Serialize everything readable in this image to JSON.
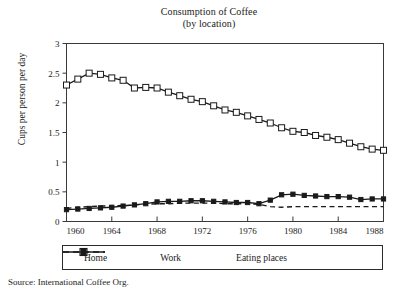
{
  "chart_data": {
    "type": "line",
    "title": "Consumption of Coffee",
    "subtitle": "(by location)",
    "xlabel": "",
    "ylabel": "Cups per person per day",
    "xlim": [
      1960,
      1988
    ],
    "ylim": [
      0,
      3
    ],
    "yticks": [
      "0",
      "0.5",
      "1",
      "1.5",
      "2",
      "2.5",
      "3"
    ],
    "ytick_values": [
      0,
      0.5,
      1,
      1.5,
      2,
      2.5,
      3
    ],
    "xticks": [
      "1960",
      "1964",
      "1968",
      "1972",
      "1976",
      "1980",
      "1984",
      "1988"
    ],
    "xtick_values": [
      1960,
      1964,
      1968,
      1972,
      1976,
      1980,
      1984,
      1988
    ],
    "grid": false,
    "legend_position": "below-axes",
    "x": [
      1960,
      1961,
      1962,
      1963,
      1964,
      1965,
      1966,
      1967,
      1968,
      1969,
      1970,
      1971,
      1972,
      1973,
      1974,
      1975,
      1976,
      1977,
      1978,
      1979,
      1980,
      1981,
      1982,
      1983,
      1984,
      1985,
      1986,
      1987,
      1988
    ],
    "series": [
      {
        "name": "Home",
        "marker": "open-square",
        "linestyle": "solid",
        "color": "#1a1a1a",
        "values": [
          2.3,
          2.4,
          2.5,
          2.48,
          2.42,
          2.38,
          2.25,
          2.26,
          2.25,
          2.18,
          2.12,
          2.06,
          2.02,
          1.95,
          1.88,
          1.84,
          1.78,
          1.72,
          1.66,
          1.58,
          1.52,
          1.5,
          1.45,
          1.42,
          1.38,
          1.32,
          1.26,
          1.22,
          1.2
        ]
      },
      {
        "name": "Work",
        "marker": "filled-square",
        "linestyle": "solid",
        "color": "#1a1a1a",
        "values": [
          0.2,
          0.21,
          0.22,
          0.23,
          0.24,
          0.26,
          0.28,
          0.3,
          0.33,
          0.34,
          0.34,
          0.35,
          0.35,
          0.34,
          0.33,
          0.32,
          0.32,
          0.3,
          0.36,
          0.45,
          0.46,
          0.44,
          0.43,
          0.42,
          0.42,
          0.41,
          0.37,
          0.38,
          0.38
        ]
      },
      {
        "name": "Eating places",
        "marker": "none",
        "linestyle": "dashed",
        "color": "#1a1a1a",
        "values": [
          0.22,
          0.24,
          0.25,
          0.26,
          0.26,
          0.27,
          0.28,
          0.29,
          0.3,
          0.3,
          0.31,
          0.31,
          0.31,
          0.31,
          0.3,
          0.3,
          0.3,
          0.29,
          0.25,
          0.24,
          0.25,
          0.25,
          0.25,
          0.25,
          0.25,
          0.25,
          0.25,
          0.25,
          0.25
        ]
      }
    ]
  },
  "legend": {
    "home_label": "Home",
    "work_label": "Work",
    "eating_label": "Eating places"
  },
  "footer": {
    "source": "Source: International Coffee Org."
  }
}
